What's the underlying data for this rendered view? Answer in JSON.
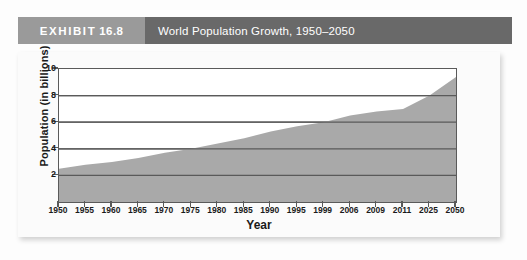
{
  "header": {
    "exhibit_label": "EXHIBIT",
    "exhibit_number": "16.8",
    "title": "World Population Growth, 1950–2050",
    "tag_color": "#9a9a9a",
    "bar_color": "#696969"
  },
  "chart_data": {
    "type": "area",
    "title": "World Population Growth, 1950–2050",
    "xlabel": "Year",
    "ylabel": "Population (in billions)",
    "categories": [
      "1950",
      "1955",
      "1960",
      "1965",
      "1970",
      "1975",
      "1980",
      "1985",
      "1990",
      "1995",
      "1999",
      "2006",
      "2009",
      "2011",
      "2025",
      "2050"
    ],
    "values": [
      2.5,
      2.8,
      3.0,
      3.3,
      3.7,
      4.0,
      4.4,
      4.8,
      5.3,
      5.7,
      6.0,
      6.5,
      6.8,
      7.0,
      8.0,
      9.4
    ],
    "series": [
      {
        "name": "World population",
        "values": [
          2.5,
          2.8,
          3.0,
          3.3,
          3.7,
          4.0,
          4.4,
          4.8,
          5.3,
          5.7,
          6.0,
          6.5,
          6.8,
          7.0,
          8.0,
          9.4
        ]
      }
    ],
    "ylim": [
      0,
      10
    ],
    "yticks": [
      2,
      4,
      6,
      8,
      10
    ],
    "ytick_labels": [
      "2",
      "4",
      "6",
      "8",
      "10"
    ],
    "grid": true,
    "legend": "none",
    "area_fill_color": "#a9a9a9",
    "grid_color": "#5a5a5a",
    "axis_color": "#5a5a5a"
  }
}
